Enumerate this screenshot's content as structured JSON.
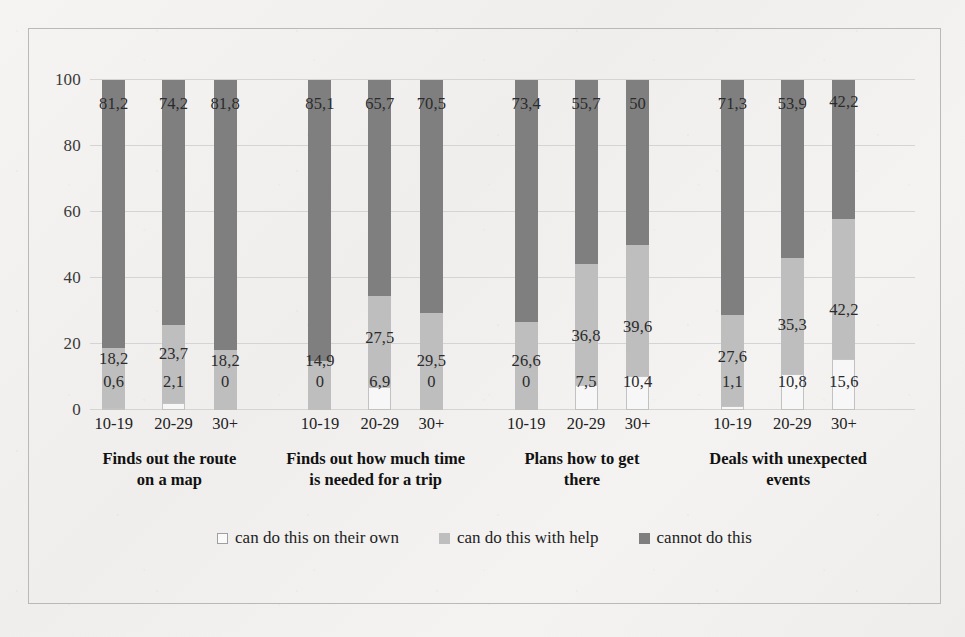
{
  "chart_data": {
    "type": "bar",
    "subtype": "stacked-100-percent",
    "title": "",
    "xlabel": "",
    "ylabel": "",
    "ylim": [
      0,
      100
    ],
    "yticks": [
      0,
      20,
      40,
      60,
      80,
      100
    ],
    "grid": true,
    "decimal_separator": ",",
    "legend_position": "bottom",
    "legend": [
      "can do this on their own",
      "can do this with help",
      "cannot do this"
    ],
    "series": [
      {
        "name": "can do this on their own",
        "color": "#f7f7f7",
        "values": [
          0.6,
          2.1,
          0,
          0,
          6.9,
          0,
          0,
          7.5,
          10.4,
          1.1,
          10.8,
          15.6
        ]
      },
      {
        "name": "can do this with help",
        "color": "#bebebe",
        "values": [
          18.2,
          23.7,
          18.2,
          14.9,
          27.5,
          29.5,
          26.6,
          36.8,
          39.6,
          27.6,
          35.3,
          42.2
        ]
      },
      {
        "name": "cannot do this",
        "color": "#7f7f7f",
        "values": [
          81.2,
          74.2,
          81.8,
          85.1,
          65.7,
          70.5,
          73.4,
          55.7,
          50,
          71.3,
          53.9,
          42.2
        ]
      }
    ],
    "value_labels": [
      [
        "0,6",
        "2,1",
        "0",
        "0",
        "6,9",
        "0",
        "0",
        "7,5",
        "10,4",
        "1,1",
        "10,8",
        "15,6"
      ],
      [
        "18,2",
        "23,7",
        "18,2",
        "14,9",
        "27,5",
        "29,5",
        "26,6",
        "36,8",
        "39,6",
        "27,6",
        "35,3",
        "42,2"
      ],
      [
        "81,2",
        "74,2",
        "81,8",
        "85,1",
        "65,7",
        "70,5",
        "73,4",
        "55,7",
        "50",
        "71,3",
        "53,9",
        "42,2"
      ]
    ],
    "groups": [
      {
        "title": "Finds out the route on a map",
        "title_line1": "Finds out the route",
        "title_line2": "on a map",
        "bars": [
          {
            "age": "10-19",
            "own": 0.6,
            "help": 18.2,
            "cannot": 81.2,
            "own_label": "0,6",
            "help_label": "18,2",
            "cannot_label": "81,2"
          },
          {
            "age": "20-29",
            "own": 2.1,
            "help": 23.7,
            "cannot": 74.2,
            "own_label": "2,1",
            "help_label": "23,7",
            "cannot_label": "74,2"
          },
          {
            "age": "30+",
            "own": 0,
            "help": 18.2,
            "cannot": 81.8,
            "own_label": "0",
            "help_label": "18,2",
            "cannot_label": "81,8"
          }
        ]
      },
      {
        "title": "Finds out how much time is needed for a trip",
        "title_line1": "Finds out how much time",
        "title_line2": "is needed for a trip",
        "bars": [
          {
            "age": "10-19",
            "own": 0,
            "help": 14.9,
            "cannot": 85.1,
            "own_label": "0",
            "help_label": "14,9",
            "cannot_label": "85,1"
          },
          {
            "age": "20-29",
            "own": 6.9,
            "help": 27.5,
            "cannot": 65.7,
            "own_label": "6,9",
            "help_label": "27,5",
            "cannot_label": "65,7"
          },
          {
            "age": "30+",
            "own": 0,
            "help": 29.5,
            "cannot": 70.5,
            "own_label": "0",
            "help_label": "29,5",
            "cannot_label": "70,5"
          }
        ]
      },
      {
        "title": "Plans how to get there",
        "title_line1": "Plans how to get",
        "title_line2": "there",
        "bars": [
          {
            "age": "10-19",
            "own": 0,
            "help": 26.6,
            "cannot": 73.4,
            "own_label": "0",
            "help_label": "26,6",
            "cannot_label": "73,4"
          },
          {
            "age": "20-29",
            "own": 7.5,
            "help": 36.8,
            "cannot": 55.7,
            "own_label": "7,5",
            "help_label": "36,8",
            "cannot_label": "55,7"
          },
          {
            "age": "30+",
            "own": 10.4,
            "help": 39.6,
            "cannot": 50,
            "own_label": "10,4",
            "help_label": "39,6",
            "cannot_label": "50"
          }
        ]
      },
      {
        "title": "Deals with unexpected events",
        "title_line1": "Deals with unexpected",
        "title_line2": "events",
        "bars": [
          {
            "age": "10-19",
            "own": 1.1,
            "help": 27.6,
            "cannot": 71.3,
            "own_label": "1,1",
            "help_label": "27,6",
            "cannot_label": "71,3"
          },
          {
            "age": "20-29",
            "own": 10.8,
            "help": 35.3,
            "cannot": 53.9,
            "own_label": "10,8",
            "help_label": "35,3",
            "cannot_label": "53,9"
          },
          {
            "age": "30+",
            "own": 15.6,
            "help": 42.2,
            "cannot": 42.2,
            "own_label": "15,6",
            "help_label": "42,2",
            "cannot_label": "42,2"
          }
        ]
      }
    ]
  },
  "colors": {
    "own": "#f7f7f7",
    "help": "#bebebe",
    "cannot": "#7f7f7f",
    "gridline": "#d4d4d4",
    "frame": "#b9b9b9",
    "background": "#f3f2f0",
    "text": "#222222"
  }
}
